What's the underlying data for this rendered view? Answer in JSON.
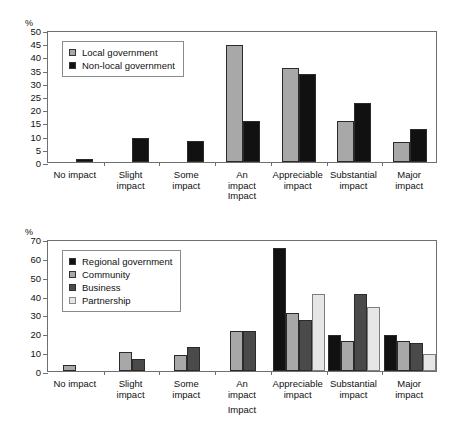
{
  "chart_data": [
    {
      "type": "bar",
      "id": "top",
      "title": "",
      "xlabel": "Impact",
      "ylabel": "%",
      "ylim": [
        0,
        50
      ],
      "ytick_step": 5,
      "yticks": [
        0,
        5,
        10,
        15,
        20,
        25,
        30,
        35,
        40,
        45,
        50
      ],
      "grid": false,
      "legend_position": "upper-left",
      "categories": [
        "No impact",
        "Slight\nimpact",
        "Some\nimpact",
        "An\nimpact",
        "Appreciable\nimpact",
        "Substantial\nimpact",
        "Major\nimpact"
      ],
      "series": [
        {
          "name": "Local government",
          "color": "#a8a8a8",
          "values": [
            0,
            0,
            0,
            44.5,
            35.5,
            15.5,
            7.5
          ]
        },
        {
          "name": "Non-local government",
          "color": "#111111",
          "values": [
            1,
            9,
            8,
            15.5,
            33.5,
            22.5,
            12.5
          ]
        }
      ]
    },
    {
      "type": "bar",
      "id": "bottom",
      "title": "",
      "xlabel": "Impact",
      "ylabel": "%",
      "ylim": [
        0,
        70
      ],
      "ytick_step": 10,
      "yticks": [
        0,
        10,
        20,
        30,
        40,
        50,
        60,
        70
      ],
      "grid": false,
      "legend_position": "upper-left",
      "categories": [
        "No impact",
        "Slight\nimpact",
        "Some\nimpact",
        "An\nimpact",
        "Appreciable\nimpact",
        "Substantial\nimpact",
        "Major\nimpact"
      ],
      "series": [
        {
          "name": "Regional government",
          "color": "#111111",
          "values": [
            0,
            0,
            0,
            0,
            65,
            19,
            19
          ]
        },
        {
          "name": "Community",
          "color": "#a8a8a8",
          "values": [
            3,
            10,
            8.5,
            21,
            31,
            16,
            16
          ]
        },
        {
          "name": "Business",
          "color": "#4a4a4a",
          "values": [
            0,
            6.5,
            12.5,
            21,
            27,
            41,
            15
          ]
        },
        {
          "name": "Partnership",
          "color": "#e6e6e6",
          "values": [
            0,
            0,
            0,
            0,
            41,
            34,
            9
          ]
        }
      ]
    }
  ]
}
